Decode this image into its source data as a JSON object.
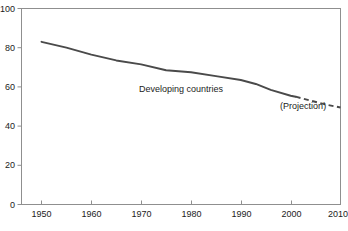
{
  "chart_data": {
    "type": "line",
    "title": "",
    "subtitle": "",
    "xlabel": "",
    "ylabel": "",
    "xlim": [
      1950,
      2010
    ],
    "ylim": [
      0,
      100
    ],
    "grid": false,
    "legend_position": "none",
    "xticks": [
      1950,
      1960,
      1970,
      1980,
      1990,
      2000,
      2010
    ],
    "xtick_labels": [
      "1950",
      "1960",
      "1970",
      "1980",
      "1990",
      "2000",
      "2010"
    ],
    "yticks": [
      0,
      20,
      40,
      60,
      80,
      100
    ],
    "ytick_labels": [
      "0",
      "20",
      "40",
      "60",
      "80",
      "100"
    ],
    "series": [
      {
        "name": "Developing countries",
        "style": "solid",
        "color": "#4a4a4a",
        "x": [
          1950,
          1955,
          1960,
          1965,
          1970,
          1975,
          1980,
          1985,
          1990,
          1993,
          1996,
          2000,
          2001
        ],
        "values": [
          83,
          80,
          76.5,
          73.5,
          71.5,
          68.5,
          67.5,
          65.5,
          63.5,
          61.5,
          58.5,
          55.5,
          55
        ]
      },
      {
        "name": "(Projection)",
        "style": "dashed",
        "color": "#4a4a4a",
        "x": [
          2001,
          2004,
          2007,
          2010
        ],
        "values": [
          55,
          53,
          51,
          49.5
        ]
      }
    ],
    "annotations": [
      {
        "text": "Developing countries",
        "x": 1978,
        "y": 57.5
      },
      {
        "text": "(Projection)",
        "x": 2002.5,
        "y": 48.5
      }
    ]
  },
  "axes": {
    "frame_color": "#8f8f8f",
    "tick_color": "#8f8f8f",
    "background": "#ffffff"
  }
}
